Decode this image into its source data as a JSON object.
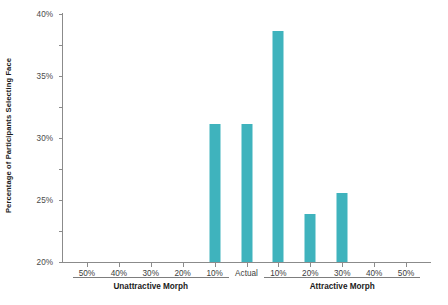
{
  "chart_data": {
    "type": "bar",
    "title": "",
    "subtitle": "",
    "xlabel": "",
    "ylabel": "Percentage of Participants Selecting Face",
    "categories": [
      "50%",
      "40%",
      "30%",
      "20%",
      "10%",
      "Actual",
      "10%",
      "20%",
      "30%",
      "40%",
      "50%"
    ],
    "values": [
      0,
      0,
      0,
      0,
      22.3,
      22.3,
      37.2,
      7.8,
      11.2,
      0,
      0
    ],
    "ylim": [
      0,
      40
    ],
    "ytick_labels": [
      "0%",
      "5%",
      "10%",
      "15%",
      "20%",
      "25%",
      "30%",
      "35%",
      "40%"
    ],
    "ytick_values": [
      0,
      5,
      10,
      15,
      20,
      25,
      30,
      35,
      40
    ],
    "grid": false,
    "legend": null,
    "bar_color": "#3fb3bd",
    "axis_color": "#8b8b8b",
    "group_labels": [
      "Unattractive Morph",
      "Attractive Morph"
    ]
  },
  "axes": {
    "y_title": "Percentage of Participants Selecting Face"
  },
  "groups": {
    "left_label": "Unattractive Morph",
    "right_label": "Attractive Morph"
  }
}
